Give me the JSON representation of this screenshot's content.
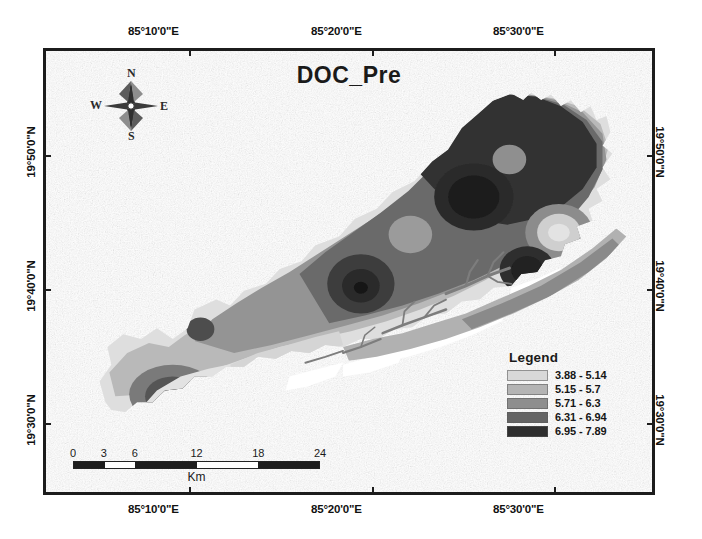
{
  "map": {
    "title": "DOC_Pre",
    "parameter": "DOC_Pre"
  },
  "axes": {
    "top_labels": [
      "85°10'0\"E",
      "85°20'0\"E",
      "85°30'0\"E"
    ],
    "bottom_labels": [
      "85°10'0\"E",
      "85°20'0\"E",
      "85°30'0\"E"
    ],
    "left_labels": [
      "19°50'0\"N",
      "19°40'0\"N",
      "19°30'0\"N"
    ],
    "right_labels": [
      "19°50'0\"N",
      "19°40'0\"N",
      "19°30'0\"N"
    ]
  },
  "compass": {
    "north": "N",
    "east": "E",
    "south": "S",
    "west": "W"
  },
  "legend": {
    "title": "Legend",
    "items": [
      {
        "label": "3.88 - 5.14",
        "color": "#d8d8d8",
        "min": 3.88,
        "max": 5.14
      },
      {
        "label": "5.15 - 5.7",
        "color": "#b4b4b4",
        "min": 5.15,
        "max": 5.7
      },
      {
        "label": "5.71 - 6.3",
        "color": "#8e8e8e",
        "min": 5.71,
        "max": 6.3
      },
      {
        "label": "6.31 - 6.94",
        "color": "#646464",
        "min": 6.31,
        "max": 6.94
      },
      {
        "label": "6.95 - 7.89",
        "color": "#2e2e2e",
        "min": 6.95,
        "max": 7.89
      }
    ]
  },
  "scalebar": {
    "ticks": [
      "0",
      "3",
      "6",
      "12",
      "18",
      "24"
    ],
    "unit": "Km",
    "max": 24
  },
  "colors": {
    "frame": "#1c1c1c",
    "background": "#ffffff",
    "text": "#1a1a1a"
  }
}
